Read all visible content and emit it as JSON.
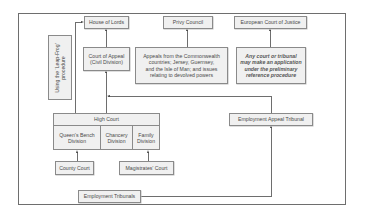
{
  "diagram": {
    "top_row": {
      "house_of_lords": "House of Lords",
      "privy_council": "Privy Council",
      "ecj": "European Court of Justice"
    },
    "leap_frog": {
      "line1": "Using the ‘Leap-Frog’",
      "line2": "procedure"
    },
    "court_of_appeal": {
      "line1": "Court of Appeal",
      "line2": "(Civil Division)"
    },
    "commonwealth": {
      "line1": "Appeals from the Commonwealth",
      "line2": "countries; Jersey, Guernsey,",
      "line3": "and the Isle of Man; and issues",
      "line4": "relating to devolved powers"
    },
    "preliminary": {
      "line1": "Any court or tribunal",
      "line2": "may make an application",
      "line3": "under the preliminary",
      "line4": "reference procedure"
    },
    "high_court": {
      "title": "High Court",
      "divisions": [
        {
          "line1": "Queen’s Bench",
          "line2": "Division"
        },
        {
          "line1": "Chancery",
          "line2": "Division"
        },
        {
          "line1": "Family",
          "line2": "Division"
        }
      ]
    },
    "employment_appeal_tribunal": "Employment Appeal Tribunal",
    "county_court": "County Court",
    "magistrates_court": "Magistrates’ Court",
    "employment_tribunals": "Employment Tribunals"
  },
  "colors": {
    "box_fill": "#f0f0f0",
    "box_border": "#8a8a8a",
    "line": "#6e6e6e",
    "text": "#4a4a4a"
  }
}
